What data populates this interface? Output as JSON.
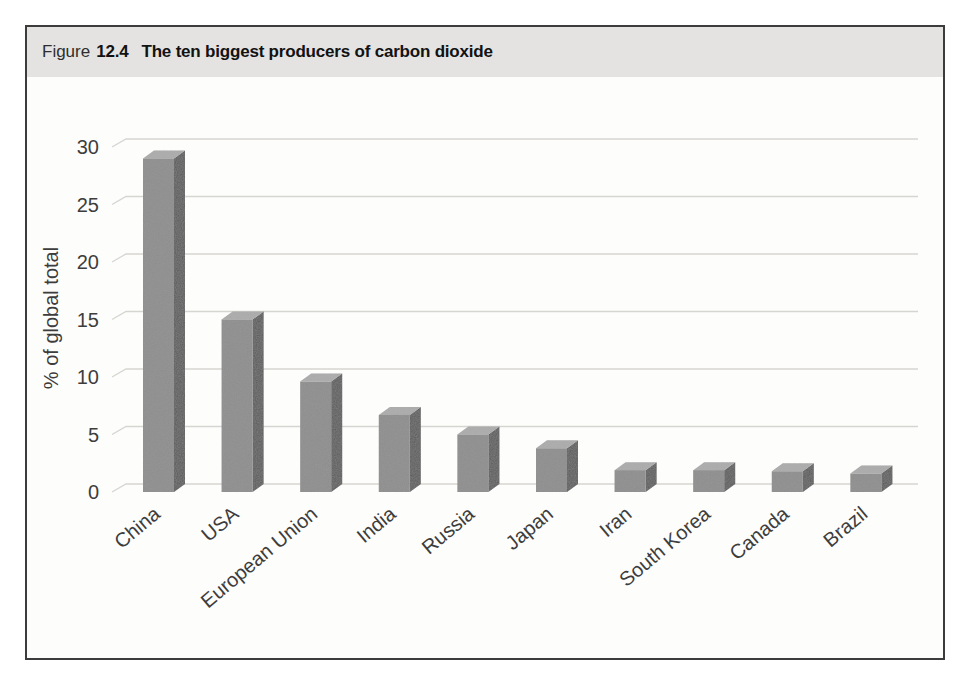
{
  "figure": {
    "label_prefix": "Figure",
    "number": "12.4",
    "title": "The ten biggest producers of carbon dioxide"
  },
  "chart_data": {
    "type": "bar",
    "style": "3d-column",
    "title": "The ten biggest producers of carbon dioxide",
    "categories": [
      "China",
      "USA",
      "European Union",
      "India",
      "Russia",
      "Japan",
      "Iran",
      "South Korea",
      "Canada",
      "Brazil"
    ],
    "values": [
      29,
      15,
      9.6,
      6.7,
      5,
      3.8,
      1.9,
      1.9,
      1.8,
      1.6
    ],
    "xlabel": "",
    "ylabel": "% of global total",
    "ylim": [
      0,
      30
    ],
    "yticks": [
      0,
      5,
      10,
      15,
      20,
      25,
      30
    ],
    "grid": true,
    "legend": false,
    "colors": {
      "bar_front": "#8d8d8d",
      "bar_side": "#595959",
      "bar_top": "#b0b0b0",
      "gridline": "#d6d5d0",
      "axis_text": "#3d3d3d",
      "header_bg": "#e4e3e1",
      "box_border": "#3c3c3c"
    }
  }
}
